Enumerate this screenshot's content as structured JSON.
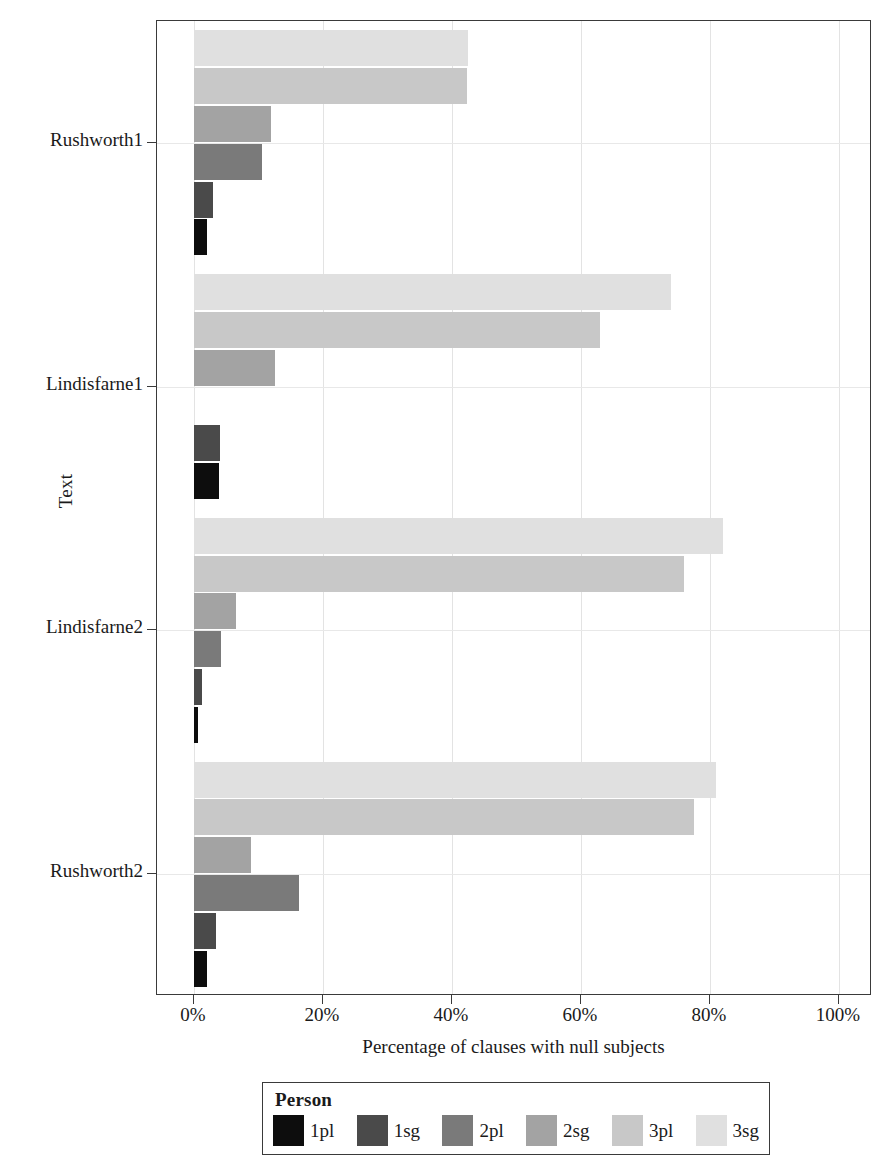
{
  "chart_data": {
    "type": "bar",
    "orientation": "horizontal",
    "title": "",
    "xlabel": "Percentage of clauses with null subjects",
    "ylabel": "Text",
    "legend_title": "Person",
    "legend_position": "bottom",
    "grid": true,
    "xlim": [
      0,
      100
    ],
    "xticks": [
      0,
      20,
      40,
      60,
      80,
      100
    ],
    "xticklabels": [
      "0%",
      "20%",
      "40%",
      "60%",
      "80%",
      "100%"
    ],
    "categories": [
      "Rushworth1",
      "Lindisfarne1",
      "Lindisfarne2",
      "Rushworth2"
    ],
    "series": [
      {
        "name": "1pl",
        "color": "#0d0d0d",
        "values": [
          2.0,
          3.8,
          0.6,
          2.0
        ]
      },
      {
        "name": "1sg",
        "color": "#4a4a4a",
        "values": [
          3.0,
          4.1,
          1.3,
          3.4
        ]
      },
      {
        "name": "2pl",
        "color": "#7a7a7a",
        "values": [
          10.5,
          0.0,
          4.2,
          16.3
        ]
      },
      {
        "name": "2sg",
        "color": "#a3a3a3",
        "values": [
          12.0,
          12.5,
          6.5,
          8.9
        ]
      },
      {
        "name": "3pl",
        "color": "#c8c8c8",
        "values": [
          42.3,
          63.0,
          76.0,
          77.5
        ]
      },
      {
        "name": "3sg",
        "color": "#e0e0e0",
        "values": [
          42.5,
          74.0,
          82.0,
          81.0
        ]
      }
    ]
  },
  "axes": {
    "y_title": "Text",
    "x_title": "Percentage of clauses with null subjects",
    "y_categories": [
      "Rushworth1",
      "Lindisfarne1",
      "Lindisfarne2",
      "Rushworth2"
    ],
    "x_ticklabels": [
      "0%",
      "20%",
      "40%",
      "60%",
      "80%",
      "100%"
    ]
  },
  "legend": {
    "title": "Person",
    "items": [
      {
        "label": "1pl",
        "color": "#0d0d0d"
      },
      {
        "label": "1sg",
        "color": "#4a4a4a"
      },
      {
        "label": "2pl",
        "color": "#7a7a7a"
      },
      {
        "label": "2sg",
        "color": "#a3a3a3"
      },
      {
        "label": "3pl",
        "color": "#c8c8c8"
      },
      {
        "label": "3sg",
        "color": "#e0e0e0"
      }
    ]
  }
}
